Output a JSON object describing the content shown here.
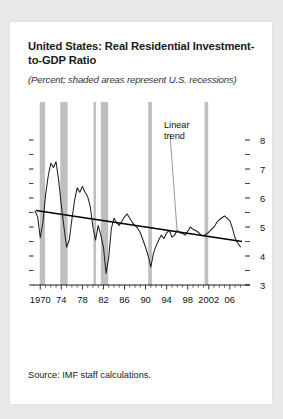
{
  "figure": {
    "title": "United States: Real Residential Investment-to-GDP Ratio",
    "subtitle": "(Percent; shaded areas represent U.S. recessions)",
    "source": "Source: IMF staff calculations.",
    "annotation": "Linear\ntrend",
    "annotation_line1": "Linear",
    "annotation_line2": "trend"
  },
  "colors": {
    "page_background": "#e8e8e8",
    "card_background": "#ffffff",
    "series_line": "#231f20",
    "trend_line": "#000000",
    "recession_band": "#bfbfbf",
    "axis": "#000000",
    "text": "#1a1a1a"
  },
  "chart_data": {
    "type": "line",
    "title": "United States: Real Residential Investment-to-GDP Ratio",
    "subtitle": "(Percent; shaded areas represent U.S. recessions)",
    "xlabel": "",
    "ylabel": "Percent",
    "xlim": [
      1969.0,
      2008.5
    ],
    "ylim": [
      3,
      8
    ],
    "yticks": [
      3,
      4,
      5,
      6,
      7,
      8
    ],
    "ytick_labels": [
      "3",
      "4",
      "5",
      "6",
      "7",
      "8"
    ],
    "yminor_ticks": [
      3.5,
      4.5,
      5.5,
      6.5,
      7.5
    ],
    "xticks": [
      1970,
      1974,
      1978,
      1982,
      1986,
      1990,
      1994,
      1998,
      2002,
      2006
    ],
    "xtick_labels": [
      "1970",
      "74",
      "78",
      "82",
      "86",
      "90",
      "94",
      "98",
      "2002",
      "06"
    ],
    "xminor_step": 1,
    "grid": false,
    "legend": false,
    "series": [
      {
        "name": "Real residential investment-to-GDP ratio",
        "x": [
          1969.0,
          1969.5,
          1970.0,
          1970.5,
          1971.0,
          1971.5,
          1972.0,
          1972.5,
          1973.0,
          1973.5,
          1974.0,
          1974.5,
          1975.0,
          1975.5,
          1976.0,
          1976.5,
          1977.0,
          1977.5,
          1978.0,
          1978.5,
          1979.0,
          1979.5,
          1980.0,
          1980.5,
          1981.0,
          1981.5,
          1982.0,
          1982.5,
          1983.0,
          1983.5,
          1984.0,
          1984.5,
          1985.0,
          1985.5,
          1986.0,
          1986.5,
          1987.0,
          1987.5,
          1988.0,
          1988.5,
          1989.0,
          1989.5,
          1990.0,
          1990.5,
          1991.0,
          1991.5,
          1992.0,
          1992.5,
          1993.0,
          1993.5,
          1994.0,
          1994.5,
          1995.0,
          1995.5,
          1996.0,
          1996.5,
          1997.0,
          1997.5,
          1998.0,
          1998.5,
          1999.0,
          1999.5,
          2000.0,
          2000.5,
          2001.0,
          2001.5,
          2002.0,
          2002.5,
          2003.0,
          2003.5,
          2004.0,
          2004.5,
          2005.0,
          2005.5,
          2006.0,
          2006.5,
          2007.0,
          2007.5,
          2008.0
        ],
        "y": [
          5.55,
          5.35,
          4.62,
          5.15,
          6.1,
          6.75,
          7.2,
          7.05,
          7.25,
          6.6,
          5.75,
          5.0,
          4.3,
          4.55,
          5.25,
          5.9,
          6.35,
          6.2,
          6.4,
          6.2,
          6.05,
          5.7,
          5.0,
          4.55,
          5.05,
          4.72,
          4.3,
          3.4,
          3.95,
          4.95,
          5.3,
          5.15,
          5.05,
          5.2,
          5.35,
          5.45,
          5.3,
          5.15,
          5.05,
          4.95,
          4.8,
          4.55,
          4.3,
          4.0,
          3.62,
          4.1,
          4.35,
          4.55,
          4.72,
          4.6,
          4.8,
          4.88,
          4.65,
          4.72,
          4.88,
          4.8,
          4.78,
          4.72,
          4.85,
          5.0,
          4.92,
          4.88,
          4.82,
          4.72,
          4.7,
          4.75,
          4.82,
          4.92,
          5.0,
          5.15,
          5.25,
          5.32,
          5.38,
          5.3,
          5.22,
          4.95,
          4.62,
          4.45,
          4.32
        ]
      }
    ],
    "trend": {
      "name": "Linear trend",
      "x": [
        1969.2,
        2008.3
      ],
      "y": [
        5.57,
        4.5
      ],
      "label": "Linear trend"
    },
    "recessions": [
      {
        "start": 1969.9,
        "end": 1970.9
      },
      {
        "start": 1973.8,
        "end": 1975.2
      },
      {
        "start": 1980.1,
        "end": 1980.6
      },
      {
        "start": 1981.5,
        "end": 1982.9
      },
      {
        "start": 1990.5,
        "end": 1991.2
      },
      {
        "start": 2001.2,
        "end": 2001.9
      }
    ]
  }
}
